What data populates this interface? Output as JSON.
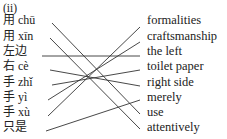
{
  "exercise": {
    "label": "(ii)",
    "left": [
      {
        "text": "用 chū",
        "y": 20
      },
      {
        "text": "用 xīn",
        "y": 36
      },
      {
        "text": "左边",
        "y": 51
      },
      {
        "text": "右 cè",
        "y": 66
      },
      {
        "text": "手 zhǐ",
        "y": 82
      },
      {
        "text": "手 yì",
        "y": 97
      },
      {
        "text": "手 xù",
        "y": 112
      },
      {
        "text": "只是",
        "y": 127
      }
    ],
    "right": [
      {
        "text": "formalities",
        "y": 20
      },
      {
        "text": "craftsmanship",
        "y": 36
      },
      {
        "text": "the left",
        "y": 51
      },
      {
        "text": "toilet paper",
        "y": 66
      },
      {
        "text": "right side",
        "y": 82
      },
      {
        "text": "merely",
        "y": 97
      },
      {
        "text": "use",
        "y": 112
      },
      {
        "text": "attentively",
        "y": 127
      }
    ],
    "matches": [
      {
        "from": 0,
        "to": 6
      },
      {
        "from": 1,
        "to": 7
      },
      {
        "from": 2,
        "to": 2
      },
      {
        "from": 3,
        "to": 4
      },
      {
        "from": 4,
        "to": 3
      },
      {
        "from": 5,
        "to": 1
      },
      {
        "from": 6,
        "to": 0
      },
      {
        "from": 7,
        "to": 5
      }
    ]
  }
}
